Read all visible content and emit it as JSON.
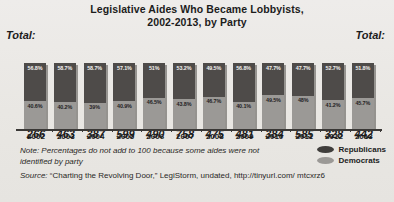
{
  "title_line1": "Legislative Aides Who Became Lobbyists,",
  "title_line2": "2002-2013, by Party",
  "total_label_left": "Total:",
  "total_label_right": "Total:",
  "note": "Note: Percentages do not add to 100 because some aides were not identified by party",
  "source_prefix": "Source:",
  "source_text": " “Charting the Revolving Door,” LegiStorm, undated, http://tinyurl.com/ mtcxrz6",
  "legend": {
    "items": [
      {
        "label": "Republicans",
        "color": "#3f3d3b",
        "icon": "ellipse-swatch-icon"
      },
      {
        "label": "Democrats",
        "color": "#9b9996",
        "icon": "ellipse-swatch-icon"
      }
    ]
  },
  "colors": {
    "republican": "#4e4b49",
    "democrat": "#9b9996",
    "background": "#eceae6",
    "axis": "#3a3836"
  },
  "chart_data": {
    "type": "bar",
    "subtype": "stacked-percentage",
    "title": "Legislative Aides Who Became Lobbyists, 2002-2013, by Party",
    "xlabel": "",
    "ylabel": "",
    "ylim": [
      0,
      100
    ],
    "grid": false,
    "legend_position": "bottom-right",
    "categories": [
      "2002",
      "2003",
      "2004",
      "2005",
      "2006",
      "2007",
      "2008",
      "2009",
      "2010",
      "2011",
      "2012",
      "2013"
    ],
    "totals": [
      266,
      463,
      387,
      599,
      490,
      758,
      475,
      481,
      384,
      585,
      328,
      442
    ],
    "total_labels": [
      "266",
      "463",
      "387",
      "599",
      "490",
      "758",
      "475",
      "481",
      "384",
      "585",
      "328",
      "442"
    ],
    "series": [
      {
        "name": "Republicans",
        "color": "#4e4b49",
        "values": [
          56.8,
          58.7,
          58.7,
          57.1,
          51,
          53.2,
          49.5,
          56.8,
          47.7,
          47.7,
          52.7,
          51.8
        ],
        "labels": [
          "56.8%",
          "58.7%",
          "58.7%",
          "57.1%",
          "51%",
          "53.2%",
          "49.5%",
          "56.8%",
          "47.7%",
          "47.7%",
          "52.7%",
          "51.8%"
        ]
      },
      {
        "name": "Democrats",
        "color": "#9b9996",
        "values": [
          40.6,
          40.2,
          39,
          40.9,
          46.5,
          43.8,
          46.7,
          40.1,
          49.5,
          48,
          41.2,
          45.7
        ],
        "labels": [
          "40.6%",
          "40.2%",
          "39%",
          "40.9%",
          "46.5%",
          "43.8%",
          "46.7%",
          "40.1%",
          "49.5%",
          "48%",
          "41.2%",
          "45.7%"
        ]
      }
    ],
    "annotations": [
      "Note: Percentages do not add to 100 because some aides were not identified by party"
    ]
  }
}
